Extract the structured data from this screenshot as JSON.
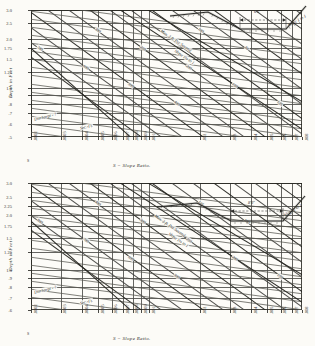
{
  "figure": {
    "background": "#fcfbf7",
    "ink": "#2b2b28"
  },
  "chart_data": [
    {
      "type": "line",
      "title": "",
      "xlabel": "S = Slope  Ratio.",
      "ylabel": "Depth  in  Feet",
      "xscale": "log",
      "yscale": "log",
      "xlim": [
        0.0002,
        0.008
      ],
      "ylim": [
        0.5,
        3.0
      ],
      "grid": true,
      "xticklabels": [
        ".0002",
        ".0003",
        ".0004",
        ".0005",
        ".0006",
        ".0007",
        ".0008",
        ".0009",
        ".001",
        ".002",
        ".003",
        ".004",
        ".005",
        ".006",
        ".007",
        ".008"
      ],
      "xtickvalues": [
        0.0002,
        0.0003,
        0.0004,
        0.0005,
        0.0006,
        0.0007,
        0.0008,
        0.0009,
        0.001,
        0.002,
        0.003,
        0.004,
        0.005,
        0.006,
        0.007,
        0.008
      ],
      "yticklabels": [
        "3.0",
        "2.5",
        "2.0",
        "1.75",
        "1.5",
        "1.25",
        "1.0",
        ".9",
        ".8",
        ".7",
        ".6",
        ".5"
      ],
      "ytickvalues": [
        3.0,
        2.5,
        2.0,
        1.75,
        1.5,
        1.25,
        1.0,
        0.9,
        0.8,
        0.7,
        0.6,
        0.5
      ],
      "annotations": [
        "Discharge - ?",
        "Sec.-Ft.",
        "Slope 1½ to 1",
        "Max. 3 ft. Per Second"
      ],
      "curve_label_text": [
        "800",
        "700",
        "600",
        "500",
        "400",
        "300",
        "250",
        "200",
        "150",
        "125",
        "100",
        "80",
        "60",
        "50",
        "40",
        "30",
        "20"
      ],
      "legend": "none"
    },
    {
      "type": "line",
      "title": "",
      "xlabel": "S = Slope  Ratio.",
      "ylabel": "Depth  in  Feet",
      "xscale": "log",
      "yscale": "log",
      "xlim": [
        0.0002,
        0.008
      ],
      "ylim": [
        0.6,
        3.0
      ],
      "grid": true,
      "xticklabels": [
        ".0002",
        ".0003",
        ".0004",
        ".0005",
        ".0006",
        ".0007",
        ".0008",
        ".0009",
        ".001",
        ".002",
        ".003",
        ".004",
        ".005",
        ".006",
        ".007",
        ".008"
      ],
      "xtickvalues": [
        0.0002,
        0.0003,
        0.0004,
        0.0005,
        0.0006,
        0.0007,
        0.0008,
        0.0009,
        0.001,
        0.002,
        0.003,
        0.004,
        0.005,
        0.006,
        0.007,
        0.008
      ],
      "yticklabels": [
        "3.0",
        "2.5",
        "2.25",
        "2.0",
        "1.75",
        "1.5",
        "1.25",
        "1.0",
        ".9",
        ".8",
        ".7",
        ".6"
      ],
      "ytickvalues": [
        3.0,
        2.5,
        2.25,
        2.0,
        1.75,
        1.5,
        1.25,
        1.0,
        0.9,
        0.8,
        0.7,
        0.6
      ],
      "annotations": [
        "Discharge - ?",
        "Sec.-Ft.",
        "Slope 1½ to 1",
        "Max. 3 ft. Per Second"
      ],
      "curve_label_text": [
        "1500",
        "800",
        "700",
        "600",
        "500",
        "400",
        "300",
        "250",
        "200",
        "150",
        "125",
        "100",
        "80",
        "60",
        "50",
        "40",
        "30"
      ],
      "legend": "none"
    }
  ],
  "panels": [
    {
      "id": "upper",
      "axis_x_title": "S = Slope  Ratio.",
      "axis_y_title": "Depth  in  Feet",
      "corner_note": "S",
      "inset": {
        "bottom_width_label": "6'6\"",
        "slope_label": "Slope 1 to 1",
        "bed_note": ""
      },
      "annotations": [
        {
          "text": "Discharge - ?",
          "rot": -14
        },
        {
          "text": "Sec.-Ft.",
          "rot": -14
        },
        {
          "text": "Max. 3 ft. Per Second",
          "rot": 34
        },
        {
          "text": "Slope 1½ to 1",
          "rot": 34
        }
      ]
    },
    {
      "id": "lower",
      "axis_x_title": "S = Slope  Ratio.",
      "axis_y_title": "Depth  in  Feet",
      "corner_note": "S",
      "inset": {
        "bottom_width_label": "8'0\"",
        "slope_label": "Slope 2 to 1",
        "bed_note": ""
      },
      "annotations": [
        {
          "text": "Discharge - ?",
          "rot": -14
        },
        {
          "text": "Sec.-Ft.",
          "rot": -14
        },
        {
          "text": "Max. 3 ft. Per Second",
          "rot": 34
        },
        {
          "text": "Slope 1½ to 1",
          "rot": 34
        }
      ]
    }
  ]
}
